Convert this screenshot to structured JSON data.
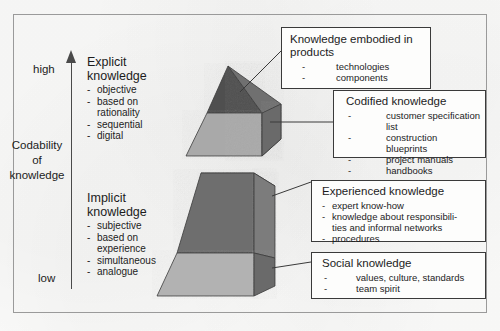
{
  "diagram": {
    "axis": {
      "title": "Codability\nof\nknowledge",
      "title_line1": "Codability",
      "title_line2": "of",
      "title_line3": "knowledge",
      "high_label": "high",
      "low_label": "low",
      "arrow_icon": "up-arrow-icon"
    },
    "knowledge_types": [
      {
        "id": "explicit",
        "heading_line1": "Explicit",
        "heading_line2": "knowledge",
        "attributes": [
          {
            "text": "objective",
            "dash": true
          },
          {
            "text": "based on",
            "dash": true
          },
          {
            "text": "rationality",
            "dash": false
          },
          {
            "text": "sequential",
            "dash": true
          },
          {
            "text": "digital",
            "dash": true
          }
        ]
      },
      {
        "id": "implicit",
        "heading_line1": "Implicit",
        "heading_line2": "knowledge",
        "attributes": [
          {
            "text": "subjective",
            "dash": true
          },
          {
            "text": "based on",
            "dash": true
          },
          {
            "text": "experience",
            "dash": false
          },
          {
            "text": "simultaneous",
            "dash": true
          },
          {
            "text": "analogue",
            "dash": true
          }
        ]
      }
    ],
    "callouts": [
      {
        "id": "products",
        "title_line1": "Knowledge embodied in",
        "title_line2": "products",
        "items": [
          {
            "text": "technologies",
            "dash": "-"
          },
          {
            "text": "components",
            "dash": "-"
          }
        ]
      },
      {
        "id": "codified",
        "title_line1": "Codified knowledge",
        "title_line2": "",
        "items": [
          {
            "text": "customer specification list",
            "dash": "-"
          },
          {
            "text": "construction blueprints",
            "dash": "-"
          },
          {
            "text": "project manuals",
            "dash": "-"
          },
          {
            "text": "handbooks",
            "dash": "-"
          }
        ]
      },
      {
        "id": "experienced",
        "title_line1": "Experienced knowledge",
        "title_line2": "",
        "items": [
          {
            "text": "expert know-how",
            "dash": "-"
          },
          {
            "text": "knowledge about responsibili-",
            "dash": "-"
          },
          {
            "text": "ties and informal networks",
            "dash": ""
          },
          {
            "text": "procedures",
            "dash": "-"
          }
        ]
      },
      {
        "id": "social",
        "title_line1": "Social knowledge",
        "title_line2": "",
        "items": [
          {
            "text": "values, culture, standards",
            "dash": "-"
          },
          {
            "text": "team spirit",
            "dash": "-"
          }
        ]
      }
    ],
    "pyramid": {
      "upper_segments": [
        {
          "name": "products-tip",
          "fill": "#555555"
        },
        {
          "name": "codified-band",
          "fill": "#a8a8a8"
        }
      ],
      "lower_segments": [
        {
          "name": "experienced-band",
          "fill": "#6e6e6e"
        },
        {
          "name": "social-band",
          "fill": "#b2b2b2"
        }
      ],
      "side_face_fill": "#7a7a7a",
      "outline": "#3a3a3a"
    },
    "colors": {
      "frame": "#9a9a9a",
      "ink": "#1c1c1c",
      "paper": "#fbfbfa",
      "dark_gray": "#555555",
      "mid_gray": "#6e6e6e",
      "light_gray": "#b2b2b2"
    }
  }
}
